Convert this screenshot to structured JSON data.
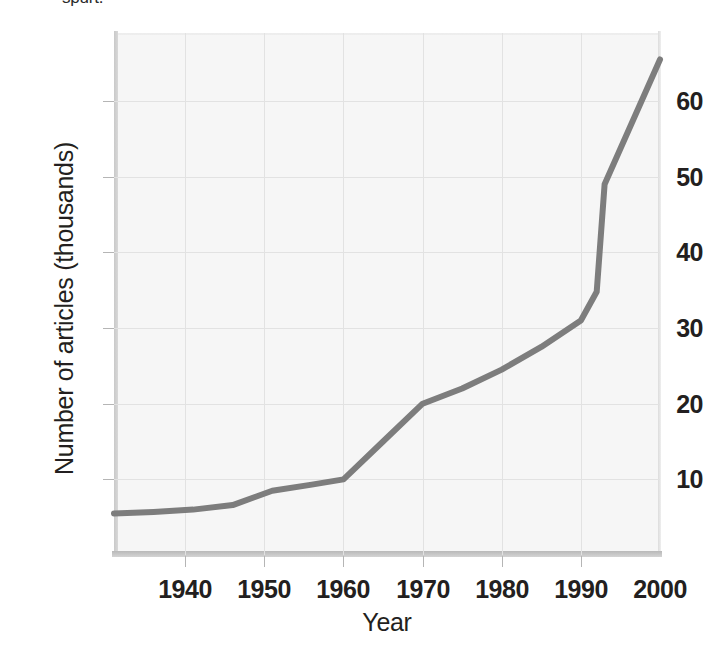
{
  "caption_fragment": "spurt.",
  "figure": {
    "name": "growth-of-scientific-articles-line-chart"
  },
  "chart_data": {
    "type": "line",
    "title": "",
    "xlabel": "Year",
    "ylabel": "Number of articles (thousands)",
    "xlim": [
      1931,
      2000
    ],
    "ylim": [
      0,
      69
    ],
    "xticks": [
      1940,
      1950,
      1960,
      1970,
      1980,
      1990,
      2000
    ],
    "xtick_labels": [
      "1940",
      "1950",
      "1960",
      "1970",
      "1980",
      "1990",
      "2000"
    ],
    "yticks": [
      10,
      20,
      30,
      40,
      50,
      60
    ],
    "ytick_labels": [
      "10",
      "20",
      "30",
      "40",
      "50",
      "60"
    ],
    "grid": true,
    "legend": "none",
    "line_color": "#7d7d7d",
    "line_width": 6,
    "series": [
      {
        "name": "Number of articles",
        "x": [
          1931,
          1936,
          1941,
          1946,
          1951,
          1956,
          1960,
          1965,
          1970,
          1975,
          1980,
          1985,
          1990,
          1992,
          1993,
          2000
        ],
        "values": [
          5.5,
          5.7,
          6.0,
          6.6,
          8.5,
          9.3,
          10.0,
          15.0,
          20.0,
          22.0,
          24.5,
          27.5,
          31.0,
          34.8,
          49.0,
          65.5
        ]
      }
    ]
  }
}
